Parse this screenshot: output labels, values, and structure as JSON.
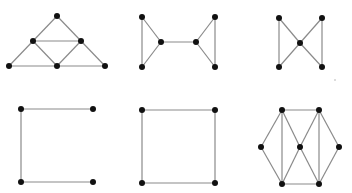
{
  "title": "Six small undirected graphs",
  "colors": {
    "edge": "#8a8a8a",
    "node": "#111111",
    "background": "#ffffff"
  },
  "graphs": [
    {
      "id": "triangle-subdivided",
      "nodes": {
        "top": [
          57,
          16
        ],
        "ml": [
          33,
          41
        ],
        "mr": [
          81,
          41
        ],
        "bl": [
          9,
          66
        ],
        "bm": [
          57,
          66
        ],
        "br": [
          105,
          66
        ]
      },
      "edges": [
        [
          "top",
          "ml"
        ],
        [
          "top",
          "mr"
        ],
        [
          "ml",
          "mr"
        ],
        [
          "ml",
          "bl"
        ],
        [
          "ml",
          "bm"
        ],
        [
          "mr",
          "bm"
        ],
        [
          "mr",
          "br"
        ],
        [
          "bl",
          "bm"
        ],
        [
          "bm",
          "br"
        ]
      ]
    },
    {
      "id": "two-triangles-bridge",
      "nodes": {
        "tl": [
          142,
          17
        ],
        "bl": [
          142,
          67
        ],
        "ml": [
          161,
          42
        ],
        "mr": [
          196,
          42
        ],
        "tr": [
          215,
          17
        ],
        "br": [
          215,
          67
        ]
      },
      "edges": [
        [
          "tl",
          "bl"
        ],
        [
          "tl",
          "ml"
        ],
        [
          "bl",
          "ml"
        ],
        [
          "ml",
          "mr"
        ],
        [
          "mr",
          "tr"
        ],
        [
          "mr",
          "br"
        ],
        [
          "tr",
          "br"
        ]
      ]
    },
    {
      "id": "butterfly",
      "nodes": {
        "tl": [
          279,
          18
        ],
        "bl": [
          279,
          67
        ],
        "c": [
          300,
          43
        ],
        "tr": [
          322,
          18
        ],
        "br": [
          322,
          67
        ]
      },
      "edges": [
        [
          "tl",
          "bl"
        ],
        [
          "tl",
          "c"
        ],
        [
          "bl",
          "c"
        ],
        [
          "c",
          "tr"
        ],
        [
          "c",
          "br"
        ],
        [
          "tr",
          "br"
        ]
      ]
    },
    {
      "id": "path-c-shape",
      "nodes": {
        "tl": [
          21,
          109
        ],
        "tr": [
          93,
          109
        ],
        "bl": [
          21,
          182
        ],
        "br": [
          93,
          182
        ]
      },
      "edges": [
        [
          "tl",
          "tr"
        ],
        [
          "tl",
          "bl"
        ],
        [
          "bl",
          "br"
        ]
      ]
    },
    {
      "id": "square-cycle",
      "nodes": {
        "tl": [
          142,
          110
        ],
        "tr": [
          215,
          110
        ],
        "bl": [
          142,
          183
        ],
        "br": [
          215,
          183
        ]
      },
      "edges": [
        [
          "tl",
          "tr"
        ],
        [
          "tr",
          "br"
        ],
        [
          "br",
          "bl"
        ],
        [
          "bl",
          "tl"
        ]
      ]
    },
    {
      "id": "hexagonal-triangulated",
      "nodes": {
        "t1": [
          282,
          110
        ],
        "t2": [
          319,
          110
        ],
        "l": [
          261,
          147
        ],
        "c": [
          300,
          147
        ],
        "r": [
          339,
          147
        ],
        "b1": [
          282,
          184
        ],
        "b2": [
          319,
          184
        ]
      },
      "edges": [
        [
          "t1",
          "t2"
        ],
        [
          "b1",
          "b2"
        ],
        [
          "l",
          "t1"
        ],
        [
          "l",
          "b1"
        ],
        [
          "t1",
          "b1"
        ],
        [
          "t1",
          "c"
        ],
        [
          "c",
          "b1"
        ],
        [
          "t2",
          "c"
        ],
        [
          "c",
          "b2"
        ],
        [
          "t2",
          "b2"
        ],
        [
          "t2",
          "r"
        ],
        [
          "r",
          "b2"
        ]
      ]
    }
  ]
}
